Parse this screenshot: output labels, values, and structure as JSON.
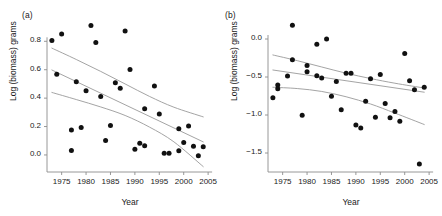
{
  "figure": {
    "background": "#ffffff",
    "point_color": "#111111",
    "line_color": "#9a9a9a",
    "axis_color": "#8c8c8c"
  },
  "panels": [
    {
      "key": "a",
      "label": "(a)",
      "xlabel": "Year",
      "ylabel": "Log (biomass) grams"
    },
    {
      "key": "b",
      "label": "(b)",
      "xlabel": "Year",
      "ylabel": "Log (biomass) grams"
    }
  ],
  "chart_data": [
    {
      "type": "scatter",
      "panel": "(a)",
      "title": "",
      "xlabel": "Year",
      "ylabel": "Log (biomass) grams",
      "xlim": [
        1972,
        2006
      ],
      "ylim": [
        -0.12,
        0.95
      ],
      "xticks": [
        1975,
        1980,
        1985,
        1990,
        1995,
        2000,
        2005
      ],
      "xticklabels": [
        "1975",
        "1980",
        "1985",
        "1990",
        "1995",
        "2000",
        "2005"
      ],
      "yticks": [
        0.0,
        0.2,
        0.4,
        0.6,
        0.8
      ],
      "yticklabels": [
        "0.0",
        "0.2",
        "0.4",
        "0.6",
        "0.8"
      ],
      "grid": false,
      "legend": null,
      "points": [
        {
          "x": 1973,
          "y": 0.805
        },
        {
          "x": 1974,
          "y": 0.568
        },
        {
          "x": 1975,
          "y": 0.852
        },
        {
          "x": 1977,
          "y": 0.175
        },
        {
          "x": 1977,
          "y": 0.032
        },
        {
          "x": 1978,
          "y": 0.515
        },
        {
          "x": 1979,
          "y": 0.193
        },
        {
          "x": 1980,
          "y": 0.452
        },
        {
          "x": 1981,
          "y": 0.912
        },
        {
          "x": 1982,
          "y": 0.792
        },
        {
          "x": 1983,
          "y": 0.412
        },
        {
          "x": 1984,
          "y": 0.101
        },
        {
          "x": 1985,
          "y": 0.208
        },
        {
          "x": 1986,
          "y": 0.509
        },
        {
          "x": 1987,
          "y": 0.47
        },
        {
          "x": 1988,
          "y": 0.872
        },
        {
          "x": 1989,
          "y": 0.602
        },
        {
          "x": 1990,
          "y": 0.04
        },
        {
          "x": 1991,
          "y": 0.083
        },
        {
          "x": 1992,
          "y": 0.065
        },
        {
          "x": 1992,
          "y": 0.325
        },
        {
          "x": 1994,
          "y": 0.485
        },
        {
          "x": 1995,
          "y": 0.288
        },
        {
          "x": 1996,
          "y": 0.012
        },
        {
          "x": 1997,
          "y": 0.012
        },
        {
          "x": 1999,
          "y": 0.185
        },
        {
          "x": 1999,
          "y": 0.03
        },
        {
          "x": 2000,
          "y": 0.088
        },
        {
          "x": 2001,
          "y": 0.203
        },
        {
          "x": 2002,
          "y": 0.062
        },
        {
          "x": 2003,
          "y": -0.005
        },
        {
          "x": 2004,
          "y": 0.058
        }
      ],
      "fit_line": {
        "name": "regression fit",
        "x": [
          1973,
          2004
        ],
        "y": [
          0.598,
          0.092
        ]
      },
      "confidence_bands": [
        {
          "name": "upper confidence limit",
          "x": [
            1973,
            1978,
            1983,
            1988,
            1993,
            1998,
            2004
          ],
          "y": [
            0.752,
            0.672,
            0.588,
            0.5,
            0.412,
            0.336,
            0.268
          ]
        },
        {
          "name": "lower confidence limit",
          "x": [
            1973,
            1978,
            1983,
            1988,
            1993,
            1998,
            2004
          ],
          "y": [
            0.44,
            0.39,
            0.338,
            0.278,
            0.196,
            0.092,
            -0.082
          ]
        }
      ]
    },
    {
      "type": "scatter",
      "panel": "(b)",
      "title": "",
      "xlabel": "Year",
      "ylabel": "Log (biomass) grams",
      "xlim": [
        1972,
        2006
      ],
      "ylim": [
        -1.75,
        0.25
      ],
      "xticks": [
        1975,
        1980,
        1985,
        1990,
        1995,
        2000,
        2005
      ],
      "xticklabels": [
        "1975",
        "1980",
        "1985",
        "1990",
        "1995",
        "2000",
        "2005"
      ],
      "yticks": [
        0.0,
        -0.5,
        -1.0,
        -1.5
      ],
      "yticklabels": [
        "0.0",
        "-0.5",
        "-1.0",
        "-1.5"
      ],
      "grid": false,
      "legend": null,
      "points": [
        {
          "x": 1973,
          "y": -0.772
        },
        {
          "x": 1974,
          "y": -0.605
        },
        {
          "x": 1974,
          "y": -0.655
        },
        {
          "x": 1976,
          "y": -0.488
        },
        {
          "x": 1977,
          "y": 0.182
        },
        {
          "x": 1977,
          "y": -0.272
        },
        {
          "x": 1979,
          "y": -1.002
        },
        {
          "x": 1980,
          "y": -0.35
        },
        {
          "x": 1980,
          "y": -0.432
        },
        {
          "x": 1982,
          "y": -0.07
        },
        {
          "x": 1982,
          "y": -0.485
        },
        {
          "x": 1983,
          "y": -0.512
        },
        {
          "x": 1984,
          "y": 0.0
        },
        {
          "x": 1985,
          "y": -0.752
        },
        {
          "x": 1986,
          "y": -0.558
        },
        {
          "x": 1987,
          "y": -0.93
        },
        {
          "x": 1988,
          "y": -0.452
        },
        {
          "x": 1989,
          "y": -0.45
        },
        {
          "x": 1990,
          "y": -1.13
        },
        {
          "x": 1991,
          "y": -1.172
        },
        {
          "x": 1992,
          "y": -0.818
        },
        {
          "x": 1993,
          "y": -0.522
        },
        {
          "x": 1994,
          "y": -1.03
        },
        {
          "x": 1995,
          "y": -0.468
        },
        {
          "x": 1996,
          "y": -0.848
        },
        {
          "x": 1997,
          "y": -1.035
        },
        {
          "x": 1998,
          "y": -0.955
        },
        {
          "x": 1999,
          "y": -1.082
        },
        {
          "x": 2000,
          "y": -0.19
        },
        {
          "x": 2001,
          "y": -0.548
        },
        {
          "x": 2002,
          "y": -0.668
        },
        {
          "x": 2003,
          "y": -1.645
        },
        {
          "x": 2004,
          "y": -0.635
        }
      ],
      "fit_line": {
        "name": "regression fit",
        "x": [
          1973,
          2004
        ],
        "y": [
          -0.408,
          -0.7
        ]
      },
      "confidence_bands": [
        {
          "name": "upper confidence limit",
          "x": [
            1973,
            1978,
            1983,
            1988,
            1993,
            1998,
            2004
          ],
          "y": [
            -0.21,
            -0.285,
            -0.368,
            -0.45,
            -0.52,
            -0.582,
            -0.645
          ]
        },
        {
          "name": "lower confidence limit",
          "x": [
            1973,
            1978,
            1983,
            1988,
            1993,
            1998,
            2004
          ],
          "y": [
            -0.635,
            -0.652,
            -0.69,
            -0.76,
            -0.855,
            -0.975,
            -1.125
          ]
        }
      ]
    }
  ]
}
